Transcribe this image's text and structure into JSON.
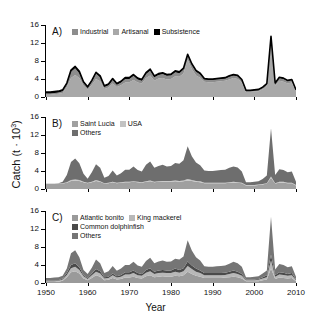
{
  "figure": {
    "axis_title_x": "Year",
    "axis_title_y_main": "Catch (t · 10",
    "axis_title_y_sup": "3",
    "axis_title_y_close": ")",
    "x_ticks": [
      "1950",
      "1960",
      "1970",
      "1980",
      "1990",
      "2000",
      "2010"
    ],
    "y_ticks": [
      "0",
      "4",
      "8",
      "12",
      "16"
    ]
  },
  "colors": {
    "industrial": "#8d8d8d",
    "artisanal": "#a8a8a8",
    "subsistence": "#000000",
    "saint_lucia": "#a0a0a0",
    "usa": "#c2c2c2",
    "others_b": "#6e6e6e",
    "atlantic_bonito": "#9a9a9a",
    "king_mackerel": "#b8b8b8",
    "common_dolphinfish": "#4a4a4a",
    "others_c": "#757575",
    "axis": "#000000"
  },
  "panels": [
    {
      "tag": "A)",
      "legend": [
        [
          {
            "label": "Industrial",
            "color": "#8d8d8d"
          },
          {
            "label": "Artisanal",
            "color": "#a8a8a8"
          },
          {
            "label": "Subsistence",
            "color": "#000000"
          }
        ]
      ]
    },
    {
      "tag": "B)",
      "legend": [
        [
          {
            "label": "Saint Lucia",
            "color": "#a0a0a0"
          },
          {
            "label": "USA",
            "color": "#c2c2c2"
          }
        ],
        [
          {
            "label": "Others",
            "color": "#6e6e6e"
          }
        ]
      ]
    },
    {
      "tag": "C)",
      "legend": [
        [
          {
            "label": "Atlantic bonito",
            "color": "#9a9a9a"
          },
          {
            "label": "King mackerel",
            "color": "#b8b8b8"
          }
        ],
        [
          {
            "label": "Common dolphinfish",
            "color": "#4a4a4a"
          }
        ],
        [
          {
            "label": "Others",
            "color": "#757575"
          }
        ]
      ]
    }
  ],
  "chart_data": [
    {
      "type": "area",
      "panel": "A",
      "title": "",
      "xlabel": "Year",
      "ylabel": "Catch (t · 10^3)",
      "xlim": [
        1950,
        2010
      ],
      "ylim": [
        0,
        16
      ],
      "grid": false,
      "stacked": true,
      "legend_position": "top-left",
      "x": [
        1950,
        1951,
        1952,
        1953,
        1954,
        1955,
        1956,
        1957,
        1958,
        1959,
        1960,
        1961,
        1962,
        1963,
        1964,
        1965,
        1966,
        1967,
        1968,
        1969,
        1970,
        1971,
        1972,
        1973,
        1974,
        1975,
        1976,
        1977,
        1978,
        1979,
        1980,
        1981,
        1982,
        1983,
        1984,
        1985,
        1986,
        1987,
        1988,
        1989,
        1990,
        1991,
        1992,
        1993,
        1994,
        1995,
        1996,
        1997,
        1998,
        1999,
        2000,
        2001,
        2002,
        2003,
        2004,
        2005,
        2006,
        2007,
        2008,
        2009,
        2010
      ],
      "series": [
        {
          "name": "Industrial",
          "values": [
            0.5,
            0.5,
            0.6,
            0.7,
            0.9,
            2.2,
            4.2,
            4.9,
            4.2,
            2.5,
            1.6,
            2.7,
            4.0,
            3.5,
            1.8,
            2.1,
            3.0,
            2.2,
            2.6,
            3.2,
            3.3,
            3.8,
            3.2,
            3.0,
            4.2,
            4.8,
            3.6,
            4.1,
            4.2,
            3.9,
            4.0,
            4.6,
            4.5,
            5.2,
            8.3,
            6.2,
            4.8,
            4.3,
            3.4,
            3.3,
            3.3,
            3.4,
            3.5,
            3.6,
            3.9,
            4.2,
            4.0,
            3.2,
            1.1,
            1.1,
            1.2,
            1.3,
            1.7,
            2.4,
            11.8,
            2.5,
            3.6,
            3.4,
            3.0,
            3.2,
            1.2
          ]
        },
        {
          "name": "Artisanal",
          "values": [
            0.3,
            0.3,
            0.3,
            0.3,
            0.4,
            0.6,
            1.4,
            1.5,
            1.1,
            0.6,
            0.4,
            0.7,
            1.2,
            0.9,
            0.4,
            0.5,
            0.8,
            0.5,
            0.6,
            0.8,
            0.7,
            0.9,
            0.7,
            0.6,
            0.9,
            1.1,
            0.8,
            0.8,
            0.9,
            0.8,
            0.8,
            0.9,
            0.8,
            0.9,
            0.9,
            0.9,
            0.8,
            0.7,
            0.5,
            0.5,
            0.5,
            0.5,
            0.5,
            0.5,
            0.6,
            0.6,
            0.6,
            0.5,
            0.2,
            0.2,
            0.2,
            0.2,
            0.3,
            0.4,
            1.4,
            0.4,
            0.6,
            0.6,
            0.5,
            0.5,
            0.2
          ]
        },
        {
          "name": "Subsistence",
          "values": [
            0.3,
            0.3,
            0.3,
            0.3,
            0.3,
            0.3,
            0.4,
            0.4,
            0.4,
            0.3,
            0.3,
            0.3,
            0.3,
            0.3,
            0.3,
            0.3,
            0.3,
            0.3,
            0.3,
            0.3,
            0.3,
            0.3,
            0.3,
            0.3,
            0.3,
            0.3,
            0.3,
            0.3,
            0.3,
            0.3,
            0.3,
            0.3,
            0.3,
            0.3,
            0.3,
            0.3,
            0.3,
            0.3,
            0.2,
            0.2,
            0.2,
            0.2,
            0.2,
            0.2,
            0.2,
            0.2,
            0.2,
            0.2,
            0.2,
            0.2,
            0.2,
            0.2,
            0.2,
            0.2,
            0.3,
            0.2,
            0.2,
            0.2,
            0.2,
            0.2,
            0.2
          ]
        }
      ],
      "peaks": [
        {
          "year": 1956,
          "total": 6.0
        },
        {
          "year": 1984,
          "total": 9.5
        },
        {
          "year": 1983,
          "total": 6.4
        },
        {
          "year": 2004,
          "total": 13.5
        }
      ]
    },
    {
      "type": "area",
      "panel": "B",
      "title": "",
      "xlabel": "Year",
      "ylabel": "Catch (t · 10^3)",
      "xlim": [
        1950,
        2010
      ],
      "ylim": [
        0,
        16
      ],
      "grid": false,
      "stacked": true,
      "legend_position": "top-left",
      "x": [
        1950,
        1951,
        1952,
        1953,
        1954,
        1955,
        1956,
        1957,
        1958,
        1959,
        1960,
        1961,
        1962,
        1963,
        1964,
        1965,
        1966,
        1967,
        1968,
        1969,
        1970,
        1971,
        1972,
        1973,
        1974,
        1975,
        1976,
        1977,
        1978,
        1979,
        1980,
        1981,
        1982,
        1983,
        1984,
        1985,
        1986,
        1987,
        1988,
        1989,
        1990,
        1991,
        1992,
        1993,
        1994,
        1995,
        1996,
        1997,
        1998,
        1999,
        2000,
        2001,
        2002,
        2003,
        2004,
        2005,
        2006,
        2007,
        2008,
        2009,
        2010
      ],
      "series": [
        {
          "name": "Saint Lucia",
          "values": [
            1.1,
            1.1,
            1.1,
            1.1,
            1.2,
            1.4,
            1.8,
            1.9,
            1.8,
            1.5,
            1.3,
            1.5,
            1.8,
            1.6,
            1.2,
            1.3,
            1.5,
            1.3,
            1.4,
            1.5,
            1.5,
            1.6,
            1.5,
            1.4,
            1.6,
            1.7,
            1.5,
            1.6,
            1.6,
            1.6,
            1.6,
            1.7,
            1.6,
            1.7,
            1.9,
            1.8,
            1.6,
            1.5,
            1.3,
            1.3,
            1.3,
            1.3,
            1.3,
            1.3,
            1.4,
            1.4,
            1.4,
            1.3,
            0.8,
            0.8,
            0.8,
            0.9,
            1.0,
            1.2,
            2.5,
            1.2,
            1.4,
            1.4,
            1.3,
            1.3,
            0.8
          ]
        },
        {
          "name": "USA",
          "values": [
            0.1,
            0.1,
            0.1,
            0.1,
            0.1,
            0.1,
            0.2,
            0.2,
            0.2,
            0.1,
            0.1,
            0.1,
            0.2,
            0.1,
            0.1,
            0.1,
            0.1,
            0.1,
            0.1,
            0.1,
            0.1,
            0.1,
            0.1,
            0.1,
            0.1,
            0.2,
            0.1,
            0.1,
            0.2,
            0.2,
            0.2,
            0.2,
            0.2,
            0.2,
            0.3,
            0.2,
            0.2,
            0.2,
            0.1,
            0.1,
            0.1,
            0.1,
            0.1,
            0.1,
            0.1,
            0.2,
            0.1,
            0.1,
            0.1,
            0.1,
            0.1,
            0.1,
            0.1,
            0.1,
            0.3,
            0.1,
            0.2,
            0.2,
            0.1,
            0.1,
            0.1
          ]
        },
        {
          "name": "Others",
          "values": [
            0.0,
            0.0,
            0.0,
            0.1,
            0.3,
            1.6,
            4.0,
            4.7,
            3.7,
            1.8,
            0.9,
            2.1,
            3.5,
            3.0,
            1.2,
            1.5,
            2.5,
            1.6,
            2.0,
            2.7,
            2.7,
            3.3,
            2.6,
            2.4,
            3.7,
            4.2,
            3.1,
            3.4,
            3.6,
            3.2,
            3.3,
            3.9,
            3.8,
            4.5,
            7.3,
            5.3,
            4.1,
            3.6,
            2.7,
            2.6,
            2.6,
            2.7,
            2.8,
            2.9,
            3.2,
            3.4,
            3.3,
            2.5,
            0.6,
            0.6,
            0.7,
            0.7,
            1.1,
            1.7,
            10.7,
            1.8,
            2.8,
            2.6,
            2.3,
            2.5,
            0.7
          ]
        }
      ],
      "peaks": [
        {
          "year": 1984,
          "total": 9.5
        },
        {
          "year": 2004,
          "total": 13.5
        }
      ]
    },
    {
      "type": "area",
      "panel": "C",
      "title": "",
      "xlabel": "Year",
      "ylabel": "Catch (t · 10^3)",
      "xlim": [
        1950,
        2010
      ],
      "ylim": [
        0,
        16
      ],
      "grid": false,
      "stacked": true,
      "legend_position": "top-left",
      "x": [
        1950,
        1951,
        1952,
        1953,
        1954,
        1955,
        1956,
        1957,
        1958,
        1959,
        1960,
        1961,
        1962,
        1963,
        1964,
        1965,
        1966,
        1967,
        1968,
        1969,
        1970,
        1971,
        1972,
        1973,
        1974,
        1975,
        1976,
        1977,
        1978,
        1979,
        1980,
        1981,
        1982,
        1983,
        1984,
        1985,
        1986,
        1987,
        1988,
        1989,
        1990,
        1991,
        1992,
        1993,
        1994,
        1995,
        1996,
        1997,
        1998,
        1999,
        2000,
        2001,
        2002,
        2003,
        2004,
        2005,
        2006,
        2007,
        2008,
        2009,
        2010
      ],
      "series": [
        {
          "name": "Atlantic bonito",
          "values": [
            0.2,
            0.2,
            0.2,
            0.3,
            0.5,
            1.3,
            2.4,
            2.6,
            2.1,
            1.0,
            0.6,
            1.1,
            1.7,
            1.4,
            0.6,
            0.7,
            1.1,
            0.8,
            0.9,
            1.2,
            1.2,
            1.4,
            1.1,
            1.0,
            1.5,
            1.7,
            1.3,
            1.4,
            1.5,
            1.4,
            1.4,
            1.6,
            1.5,
            1.7,
            2.5,
            2.0,
            1.6,
            1.4,
            1.1,
            1.1,
            1.1,
            1.1,
            1.1,
            1.2,
            1.3,
            1.4,
            1.3,
            1.0,
            0.4,
            0.4,
            0.4,
            0.4,
            0.6,
            0.8,
            3.2,
            0.9,
            1.2,
            1.1,
            1.0,
            1.1,
            0.4
          ]
        },
        {
          "name": "King mackerel",
          "values": [
            0.2,
            0.2,
            0.2,
            0.2,
            0.3,
            0.5,
            0.9,
            1.0,
            0.8,
            0.5,
            0.3,
            0.6,
            0.8,
            0.7,
            0.4,
            0.4,
            0.6,
            0.4,
            0.5,
            0.7,
            0.7,
            0.8,
            0.6,
            0.6,
            0.8,
            0.9,
            0.7,
            0.8,
            0.8,
            0.8,
            0.8,
            0.9,
            0.8,
            0.9,
            1.3,
            1.1,
            0.9,
            0.8,
            0.6,
            0.6,
            0.6,
            0.6,
            0.6,
            0.6,
            0.7,
            0.8,
            0.7,
            0.6,
            0.2,
            0.2,
            0.2,
            0.3,
            0.4,
            0.5,
            1.8,
            0.5,
            0.7,
            0.7,
            0.6,
            0.6,
            0.2
          ]
        },
        {
          "name": "Common dolphinfish",
          "values": [
            0.1,
            0.1,
            0.1,
            0.1,
            0.2,
            0.4,
            0.7,
            0.8,
            0.6,
            0.3,
            0.2,
            0.4,
            0.6,
            0.5,
            0.3,
            0.3,
            0.4,
            0.3,
            0.4,
            0.5,
            0.5,
            0.6,
            0.5,
            0.4,
            0.6,
            0.7,
            0.5,
            0.6,
            0.6,
            0.6,
            0.6,
            0.7,
            0.6,
            0.7,
            1.0,
            0.8,
            0.7,
            0.6,
            0.5,
            0.5,
            0.5,
            0.5,
            0.5,
            0.5,
            0.5,
            0.6,
            0.5,
            0.4,
            0.2,
            0.2,
            0.2,
            0.2,
            0.3,
            0.4,
            1.3,
            0.4,
            0.5,
            0.5,
            0.4,
            0.5,
            0.2
          ]
        },
        {
          "name": "Others",
          "values": [
            0.6,
            0.6,
            0.7,
            0.7,
            0.6,
            1.0,
            2.6,
            2.9,
            2.2,
            1.1,
            0.9,
            1.3,
            2.1,
            1.8,
            0.9,
            1.2,
            1.7,
            1.2,
            1.4,
            1.6,
            1.6,
            1.9,
            1.7,
            1.6,
            2.0,
            2.3,
            1.9,
            2.0,
            2.1,
            1.9,
            2.0,
            2.2,
            2.3,
            2.6,
            4.7,
            3.3,
            2.5,
            2.2,
            1.5,
            1.4,
            1.4,
            1.5,
            1.6,
            1.6,
            1.8,
            1.9,
            1.9,
            1.6,
            0.5,
            0.5,
            0.6,
            0.6,
            0.8,
            1.1,
            8.4,
            1.2,
            1.8,
            1.7,
            1.5,
            1.5,
            0.6
          ]
        }
      ],
      "peaks": [
        {
          "year": 1984,
          "total": 9.5
        },
        {
          "year": 2004,
          "total": 13.5
        }
      ]
    }
  ]
}
